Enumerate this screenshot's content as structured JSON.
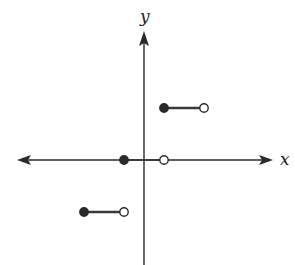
{
  "chart_data": {
    "type": "line",
    "title": "",
    "xlabel": "x",
    "ylabel": "y",
    "grid": false,
    "legend": null,
    "axes": {
      "x_arrows": "both",
      "y_arrows": "top",
      "tick_labels": []
    },
    "segments": [
      {
        "x_start": -1.5,
        "x_end": -0.5,
        "y": -1,
        "start_closed": true,
        "end_closed": false
      },
      {
        "x_start": -0.5,
        "x_end": 0.5,
        "y": 0,
        "start_closed": true,
        "end_closed": false
      },
      {
        "x_start": 0.5,
        "x_end": 1.5,
        "y": 1,
        "start_closed": true,
        "end_closed": false
      }
    ],
    "colors": {
      "axis": "#2a2a2a",
      "segment": "#3a3a3a",
      "filled_dot": "#2a2a2a",
      "open_dot_fill": "#ffffff"
    }
  },
  "labels": {
    "x_axis": "x",
    "y_axis": "y"
  }
}
